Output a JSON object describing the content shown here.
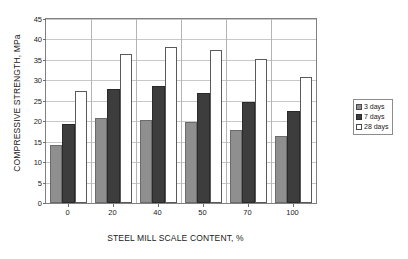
{
  "chart_data": {
    "type": "bar",
    "title": "",
    "xlabel": "STEEL MILL SCALE CONTENT, %",
    "ylabel": "COMPRESSIVE STRENGTH, MPa",
    "categories": [
      "0",
      "20",
      "40",
      "50",
      "70",
      "100"
    ],
    "series": [
      {
        "name": "3 days",
        "color": "#8f8f8f",
        "values": [
          14.3,
          20.9,
          20.4,
          19.7,
          17.9,
          16.4
        ]
      },
      {
        "name": "7 days",
        "color": "#3d3d3d",
        "values": [
          19.3,
          27.9,
          28.5,
          27.0,
          24.6,
          22.5
        ]
      },
      {
        "name": "28 days",
        "color": "#ffffff",
        "values": [
          27.4,
          36.5,
          38.2,
          37.5,
          35.1,
          30.8
        ]
      }
    ],
    "ylim": [
      0,
      45
    ],
    "ytick_labels": [
      "0",
      "5",
      "10",
      "15",
      "20",
      "25",
      "30",
      "35",
      "40",
      "45"
    ],
    "ytick_values": [
      0,
      5,
      10,
      15,
      20,
      25,
      30,
      35,
      40,
      45
    ],
    "grid": true,
    "legend_position": "right",
    "legend_entries": [
      "3 days",
      "7 days",
      "28 days"
    ]
  }
}
